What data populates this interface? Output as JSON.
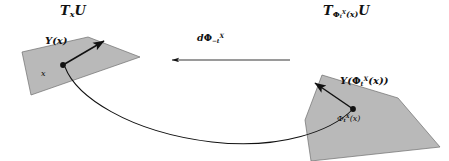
{
  "figure": {
    "caption_type": "differential-geometry-pushforward-diagram",
    "background_color": "#ffffff",
    "plane_fill_color": "#b9b9b9",
    "plane_stroke_color": "#6f6f6f",
    "ink_color": "#111111"
  },
  "labels": {
    "tangent_space_left": {
      "base": "T",
      "subscript": "x",
      "manifold": "U"
    },
    "tangent_space_right": {
      "base": "T",
      "sub_base": "Φ",
      "sub_sub": "t",
      "sub_sup": "X",
      "sub_arg": "(x)",
      "manifold": "U"
    },
    "differential_map": {
      "d": "d",
      "phi": "Φ",
      "subscript": "−t",
      "superscript": "X"
    },
    "vector_left": {
      "name": "Y",
      "arg": "(x)"
    },
    "point_left": "x",
    "vector_right": {
      "name": "Y",
      "open": "(",
      "phi": "Φ",
      "subscript": "t",
      "superscript": "X",
      "arg": "(x)",
      "close": ")"
    },
    "point_right": {
      "phi": "Φ",
      "subscript": "t",
      "superscript": "X",
      "arg": "(x)"
    }
  },
  "geometry": {
    "left_plane_points": "22,52 88,37 140,57 31,95",
    "right_plane_points": "322,75 398,98 440,147 311,161 305,120",
    "left_base_point": [
      63,
      65
    ],
    "right_base_point": [
      353,
      109
    ],
    "left_vector_tip": [
      104,
      41
    ],
    "right_vector_tip": [
      315,
      83
    ],
    "map_arrow": {
      "from_x": 290,
      "to_x": 172,
      "y": 60
    },
    "flow_curve": "M 65,67 C 76,96 128,132 212,142 C 280,150 330,130 352,110"
  }
}
